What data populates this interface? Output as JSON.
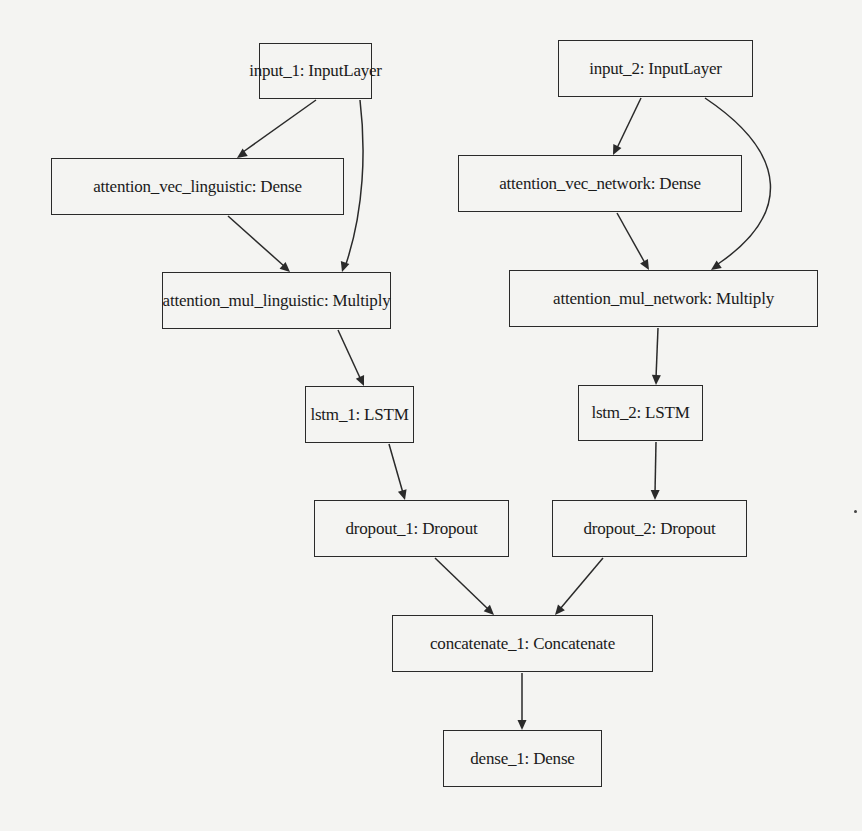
{
  "diagram": {
    "type": "neural-network-model-graph",
    "nodes": [
      {
        "id": "input_1",
        "label": "input_1: InputLayer",
        "x": 259,
        "y": 43,
        "w": 113,
        "h": 56
      },
      {
        "id": "input_2",
        "label": "input_2: InputLayer",
        "x": 558,
        "y": 40,
        "w": 195,
        "h": 57
      },
      {
        "id": "attention_vec_linguistic",
        "label": "attention_vec_linguistic: Dense",
        "x": 51,
        "y": 158,
        "w": 293,
        "h": 57
      },
      {
        "id": "attention_vec_network",
        "label": "attention_vec_network: Dense",
        "x": 458,
        "y": 155,
        "w": 284,
        "h": 57
      },
      {
        "id": "attention_mul_linguistic",
        "label": "attention_mul_linguistic: Multiply",
        "x": 162,
        "y": 272,
        "w": 229,
        "h": 57
      },
      {
        "id": "attention_mul_network",
        "label": "attention_mul_network: Multiply",
        "x": 509,
        "y": 270,
        "w": 309,
        "h": 57
      },
      {
        "id": "lstm_1",
        "label": "lstm_1: LSTM",
        "x": 305,
        "y": 386,
        "w": 109,
        "h": 57
      },
      {
        "id": "lstm_2",
        "label": "lstm_2: LSTM",
        "x": 578,
        "y": 385,
        "w": 125,
        "h": 56
      },
      {
        "id": "dropout_1",
        "label": "dropout_1: Dropout",
        "x": 314,
        "y": 500,
        "w": 195,
        "h": 57
      },
      {
        "id": "dropout_2",
        "label": "dropout_2: Dropout",
        "x": 552,
        "y": 500,
        "w": 195,
        "h": 57
      },
      {
        "id": "concatenate_1",
        "label": "concatenate_1: Concatenate",
        "x": 392,
        "y": 615,
        "w": 261,
        "h": 57
      },
      {
        "id": "dense_1",
        "label": "dense_1: Dense",
        "x": 443,
        "y": 730,
        "w": 159,
        "h": 57
      }
    ],
    "edges": [
      {
        "from": "input_1",
        "to": "attention_vec_linguistic",
        "path": "M 316 100 L 243 152",
        "tip": [
          237,
          158
        ],
        "angle": 145
      },
      {
        "from": "input_1",
        "to": "attention_mul_linguistic",
        "path": "M 360 100 C 366 150, 364 210, 346 264",
        "tip": [
          342,
          272
        ],
        "angle": 108
      },
      {
        "from": "attention_vec_linguistic",
        "to": "attention_mul_linguistic",
        "path": "M 228 216 L 284 266",
        "tip": [
          290,
          272
        ],
        "angle": 42
      },
      {
        "from": "input_2",
        "to": "attention_vec_network",
        "path": "M 641 98 L 617 148",
        "tip": [
          613,
          155
        ],
        "angle": 116
      },
      {
        "from": "input_2",
        "to": "attention_mul_network",
        "path": "M 705 98 C 790 155, 790 215, 718 264",
        "tip": [
          711,
          270
        ],
        "angle": 145
      },
      {
        "from": "attention_vec_network",
        "to": "attention_mul_network",
        "path": "M 617 213 L 645 263",
        "tip": [
          649,
          270
        ],
        "angle": 60
      },
      {
        "from": "attention_mul_linguistic",
        "to": "lstm_1",
        "path": "M 338 330 L 361 380",
        "tip": [
          364,
          386
        ],
        "angle": 66
      },
      {
        "from": "attention_mul_network",
        "to": "lstm_2",
        "path": "M 658 328 L 656 378",
        "tip": [
          656,
          385
        ],
        "angle": 92
      },
      {
        "from": "lstm_1",
        "to": "dropout_1",
        "path": "M 389 444 L 403 493",
        "tip": [
          405,
          500
        ],
        "angle": 74
      },
      {
        "from": "lstm_2",
        "to": "dropout_2",
        "path": "M 656 442 L 655 493",
        "tip": [
          655,
          500
        ],
        "angle": 91
      },
      {
        "from": "dropout_1",
        "to": "concatenate_1",
        "path": "M 435 558 L 488 609",
        "tip": [
          494,
          615
        ],
        "angle": 44
      },
      {
        "from": "dropout_2",
        "to": "concatenate_1",
        "path": "M 603 558 L 560 609",
        "tip": [
          555,
          615
        ],
        "angle": 130
      },
      {
        "from": "concatenate_1",
        "to": "dense_1",
        "path": "M 522 673 L 522 723",
        "tip": [
          522,
          730
        ],
        "angle": 90
      }
    ],
    "colors": {
      "background": "#f4f4f2",
      "stroke": "#2a2a2a",
      "text": "#1a1a1a"
    }
  }
}
